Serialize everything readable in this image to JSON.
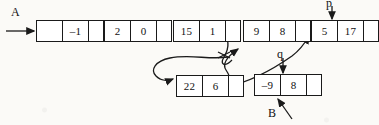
{
  "diagram": {
    "ink_color": "#1a1a1a",
    "background_color": "#fbfaf7",
    "pointer_labels": [
      {
        "name": "list-head-label-A",
        "text": "A"
      },
      {
        "name": "pointer-label-p",
        "text": "p"
      },
      {
        "name": "pointer-label-q",
        "text": "q"
      },
      {
        "name": "list-head-label-B",
        "text": "B"
      }
    ],
    "nodes": [
      {
        "id": "node-head-a",
        "name": "node-head-a",
        "cells": [
          {
            "name": "node-head-a-cell-1",
            "text": ""
          },
          {
            "name": "node-head-a-cell-2",
            "text": "–1"
          },
          {
            "name": "node-head-a-pointer-cell",
            "text": ""
          }
        ]
      },
      {
        "id": "node-2-0",
        "name": "node-2-0",
        "cells": [
          {
            "name": "node-2-0-cell-1",
            "text": "2"
          },
          {
            "name": "node-2-0-cell-2",
            "text": "0"
          },
          {
            "name": "node-2-0-pointer-cell",
            "text": ""
          }
        ]
      },
      {
        "id": "node-15-1",
        "name": "node-15-1",
        "cells": [
          {
            "name": "node-15-1-cell-1",
            "text": "15"
          },
          {
            "name": "node-15-1-cell-2",
            "text": "1"
          },
          {
            "name": "node-15-1-pointer-cell",
            "text": ""
          }
        ]
      },
      {
        "id": "node-9-8",
        "name": "node-9-8",
        "cells": [
          {
            "name": "node-9-8-cell-1",
            "text": "9"
          },
          {
            "name": "node-9-8-cell-2",
            "text": "8"
          },
          {
            "name": "node-9-8-pointer-cell",
            "text": ""
          }
        ]
      },
      {
        "id": "node-5-17",
        "name": "node-5-17",
        "cells": [
          {
            "name": "node-5-17-cell-1",
            "text": "5"
          },
          {
            "name": "node-5-17-cell-2",
            "text": "17"
          },
          {
            "name": "node-5-17-pointer-cell",
            "text": ""
          }
        ]
      },
      {
        "id": "node-22-6",
        "name": "node-22-6",
        "cells": [
          {
            "name": "node-22-6-cell-1",
            "text": "22"
          },
          {
            "name": "node-22-6-cell-2",
            "text": "6"
          },
          {
            "name": "node-22-6-pointer-cell",
            "text": ""
          }
        ]
      },
      {
        "id": "node-neg9-8",
        "name": "node-neg9-8",
        "cells": [
          {
            "name": "node-neg9-8-cell-1",
            "text": "–9"
          },
          {
            "name": "node-neg9-8-cell-2",
            "text": "8"
          },
          {
            "name": "node-neg9-8-pointer-cell",
            "text": ""
          }
        ]
      }
    ],
    "connections": [
      {
        "name": "arrow-a-to-head",
        "from": "A",
        "to": "node-head-a",
        "style": "straight"
      },
      {
        "name": "arrow-head-to-2-0",
        "from": "node-head-a",
        "to": "node-2-0",
        "style": "straight"
      },
      {
        "name": "arrow-2-0-to-15-1",
        "from": "node-2-0",
        "to": "node-15-1",
        "style": "straight"
      },
      {
        "name": "arrow-15-1-to-9-8",
        "from": "node-15-1",
        "to": "node-9-8",
        "style": "curved-crossed-out"
      },
      {
        "name": "arrow-9-8-to-5-17",
        "from": "node-9-8",
        "to": "node-5-17",
        "style": "straight-crossed-out"
      },
      {
        "name": "arrow-to-22-6",
        "from": "node-15-1",
        "to": "node-22-6",
        "style": "curved-loop"
      },
      {
        "name": "arrow-22-6-to-9-8",
        "from": "node-22-6",
        "to": "node-9-8",
        "style": "curved"
      },
      {
        "name": "arrow-neg9-8-to-5-17",
        "from": "node-neg9-8",
        "to": "node-5-17",
        "style": "curved"
      },
      {
        "name": "arrow-p-to-5-17",
        "from": "p",
        "to": "node-5-17",
        "style": "vertical-down"
      },
      {
        "name": "arrow-q-to-neg9-8",
        "from": "q",
        "to": "node-neg9-8",
        "style": "vertical-down"
      },
      {
        "name": "arrow-b-to-neg9-8",
        "from": "B",
        "to": "node-neg9-8",
        "style": "diagonal-up"
      }
    ]
  }
}
